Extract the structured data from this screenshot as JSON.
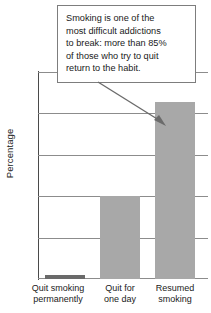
{
  "chart_data": {
    "type": "bar",
    "title": "",
    "xlabel": "",
    "ylabel": "Percentage",
    "ylim": [
      0,
      100
    ],
    "yticks": [
      0,
      20,
      40,
      60,
      80,
      100
    ],
    "grid": true,
    "legend": false,
    "categories": [
      "Quit smoking\npermanently",
      "Quit for\none day",
      "Resumed\nsmoking"
    ],
    "values": [
      2,
      40.5,
      86
    ],
    "bar_colors": [
      "#6a6a6a",
      "#a8a8a8",
      "#a8a8a8"
    ],
    "annotations": [
      {
        "text": "Smoking is one of the\nmost difficult addictions\nto break: more than 85%\nof those who try to quit\nreturn to the habit.",
        "points_to": "Resumed smoking"
      }
    ]
  },
  "axis": {
    "y_title": "Percentage",
    "ticks": [
      "100",
      "80",
      "60",
      "40",
      "20",
      "0"
    ]
  },
  "bars": [
    {
      "label": "Quit smoking\npermanently",
      "value": 2
    },
    {
      "label": "Quit for\none day",
      "value": 40.5
    },
    {
      "label": "Resumed\nsmoking",
      "value": 86
    }
  ],
  "annotation": {
    "text": "Smoking is one of the\nmost difficult addictions\nto break: more than 85%\nof those who try to quit\nreturn to the habit."
  },
  "colors": {
    "bar_dark": "#6a6a6a",
    "bar_light": "#a8a8a8",
    "gridline": "#8c8c8c",
    "axis": "#4a4a4a",
    "text": "#1a1a1a",
    "box_border": "#7d7d7d"
  }
}
